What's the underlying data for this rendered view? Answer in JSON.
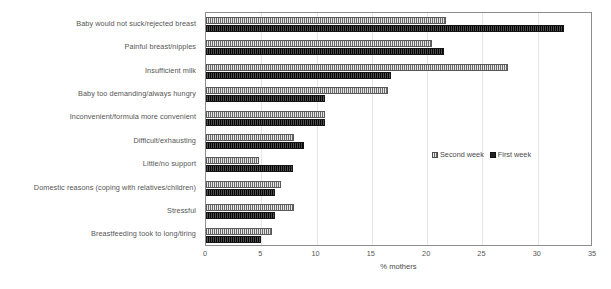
{
  "chart_data": {
    "type": "bar",
    "orientation": "horizontal",
    "title": "",
    "xlabel": "% mothers",
    "ylabel": "",
    "xlim": [
      0,
      35
    ],
    "xticks": [
      0,
      5,
      10,
      15,
      20,
      25,
      30,
      35
    ],
    "grid": true,
    "legend_position": "middle-right",
    "categories": [
      "Baby would not suck/rejected breast",
      "Painful breast/nipples",
      "Insufficient milk",
      "Baby too demanding/always hungry",
      "Inconvenient/formula more convenient",
      "Difficult/exhausting",
      "Little/no support",
      "Domestic reasons (coping with relatives/children)",
      "Stressful",
      "Breastfeeding took to long/tiring"
    ],
    "series": [
      {
        "name": "Second week",
        "color": "#9d9d9d",
        "values": [
          21.7,
          20.4,
          27.3,
          16.5,
          10.8,
          8.0,
          4.8,
          6.8,
          8.0,
          6.0
        ]
      },
      {
        "name": "First week",
        "color": "#2b2b2b",
        "values": [
          32.4,
          21.5,
          16.7,
          10.8,
          10.8,
          8.9,
          7.9,
          6.2,
          6.2,
          5.0
        ]
      }
    ]
  },
  "legend": {
    "entries": [
      {
        "label": "Second week"
      },
      {
        "label": "First week"
      }
    ]
  }
}
